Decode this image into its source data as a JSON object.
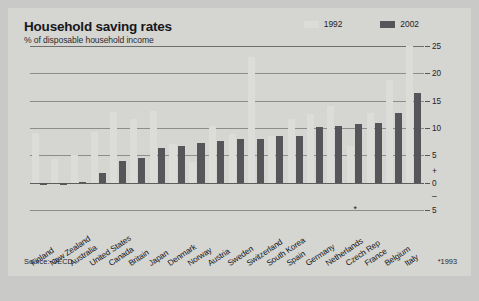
{
  "header": {
    "title": "Household saving rates",
    "subtitle": "% of disposable household income"
  },
  "legend": {
    "items": [
      {
        "label": "1992",
        "color": "#dcdcd9"
      },
      {
        "label": "2002",
        "color": "#56565a"
      }
    ]
  },
  "footer": {
    "source": "Source: OECD",
    "footnote": "*1993"
  },
  "annotations": {
    "asterisk": "*"
  },
  "chart_data": {
    "type": "bar",
    "title": "Household saving rates",
    "subtitle": "% of disposable household income",
    "xlabel": "",
    "ylabel": "% of disposable household income",
    "ylim": [
      -5,
      25
    ],
    "yticks": [
      -5,
      0,
      5,
      10,
      15,
      20,
      25
    ],
    "ytick_labels": [
      "5",
      "0",
      "5",
      "10",
      "15",
      "20",
      "25"
    ],
    "grid": true,
    "legend_position": "top-right",
    "categories": [
      "Finland",
      "New Zealand",
      "Australia",
      "United States",
      "Canada",
      "Britain",
      "Japan",
      "Denmark",
      "Norway",
      "Austria",
      "Sweden",
      "Switzerland",
      "South Korea",
      "Spain",
      "Germany",
      "Netherlands",
      "Czech Rep",
      "France",
      "Belgium",
      "Italy"
    ],
    "category_notes": {
      "Czech Rep": "*1993"
    },
    "series": [
      {
        "name": "1992",
        "color": "#dcdcd9",
        "values": [
          9.0,
          4.4,
          5.1,
          9.2,
          13.0,
          11.6,
          13.2,
          7.0,
          3.7,
          10.3,
          8.9,
          23.0,
          8.6,
          11.7,
          12.6,
          14.1,
          6.8,
          12.8,
          18.8,
          25.0
        ]
      },
      {
        "name": "2002",
        "color": "#56565a",
        "values": [
          -0.4,
          -0.4,
          0.2,
          1.8,
          4.0,
          4.6,
          6.4,
          6.7,
          7.3,
          7.6,
          8.0,
          8.0,
          8.5,
          8.6,
          10.2,
          10.3,
          10.7,
          11.0,
          12.7,
          16.4
        ]
      }
    ]
  }
}
